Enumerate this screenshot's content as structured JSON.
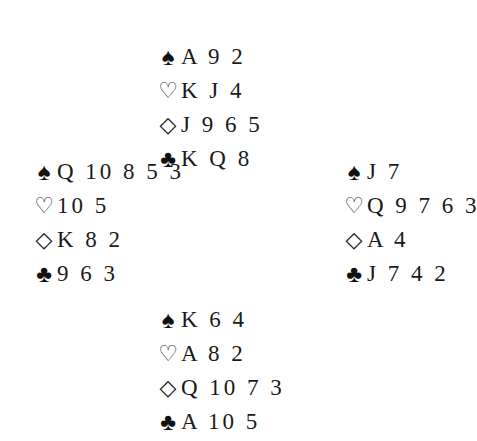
{
  "deal": {
    "north": {
      "spades": "A 9 2",
      "hearts": "K J 4",
      "diamonds": "J 9 6 5",
      "clubs": "K Q 8"
    },
    "west": {
      "spades": "Q 10 8 5 3",
      "hearts": "10 5",
      "diamonds": "K 8 2",
      "clubs": "9 6 3"
    },
    "east": {
      "spades": "J 7",
      "hearts": "Q 9 7 6 3",
      "diamonds": "A 4",
      "clubs": "J 7 4 2"
    },
    "south": {
      "spades": "K 6 4",
      "hearts": "A 8 2",
      "diamonds": "Q 10 7 3",
      "clubs": "A 10 5"
    }
  },
  "suit_symbols": {
    "spades": "♠",
    "hearts": "♡",
    "diamonds": "◇",
    "clubs": "♣"
  }
}
